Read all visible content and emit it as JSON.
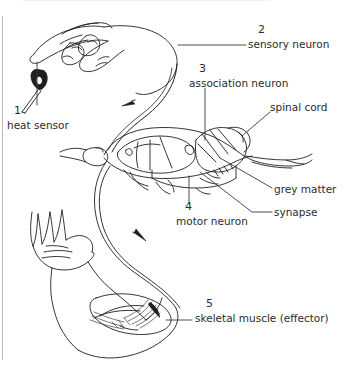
{
  "figure": {
    "type": "biology-diagram",
    "frame": {
      "left_rule_color": "#b8b8b8",
      "background": "#ffffff",
      "ink": "#1f1f1f",
      "text_color": "#2b2b2b"
    }
  },
  "labels": [
    {
      "id": "heat-sensor",
      "number": "1",
      "text": "heat sensor",
      "num_x": 14,
      "num_y": 111,
      "text_x": 9,
      "text_y": 124,
      "leader": "vertical-up-to-fingertip"
    },
    {
      "id": "sensory-neuron",
      "number": "2",
      "text": "sensory neuron",
      "num_x": 260,
      "num_y": 29,
      "text_x": 250,
      "text_y": 42,
      "leader": "horizontal-left"
    },
    {
      "id": "association-neuron",
      "number": "3",
      "text": "association neuron",
      "num_x": 200,
      "num_y": 68,
      "text_x": 190,
      "text_y": 81,
      "leader": "vertical-down"
    },
    {
      "id": "motor-neuron",
      "number": "4",
      "text": "motor neuron",
      "num_x": 186,
      "num_y": 207,
      "text_x": 177,
      "text_y": 220,
      "leader": "vertical-up"
    },
    {
      "id": "skeletal-muscle",
      "number": "5",
      "text": "skeletal muscle (effector)",
      "num_x": 207,
      "num_y": 303,
      "text_x": 196,
      "text_y": 317,
      "leader": "horizontal-left"
    },
    {
      "id": "spinal-cord",
      "number": "",
      "text": "spinal cord",
      "num_x": 0,
      "num_y": 0,
      "text_x": 271,
      "text_y": 106,
      "leader": "diagonal-down-left"
    },
    {
      "id": "grey-matter",
      "number": "",
      "text": "grey matter",
      "num_x": 0,
      "num_y": 0,
      "text_x": 276,
      "text_y": 189,
      "leader": "diagonal-up-left"
    },
    {
      "id": "synapse",
      "number": "",
      "text": "synapse",
      "num_x": 0,
      "num_y": 0,
      "text_x": 276,
      "text_y": 209,
      "leader": "horizontal-left"
    }
  ],
  "arrows": [
    {
      "id": "afferent-arrow",
      "direction": "toward-spinal-cord",
      "on": "sensory pathway"
    },
    {
      "id": "efferent-arrow",
      "direction": "toward-muscle",
      "on": "motor pathway"
    }
  ],
  "drawing_parts": [
    {
      "id": "pointing-hand",
      "description": "hand with extended index finger touching flame/heat source"
    },
    {
      "id": "heat-source",
      "description": "small dark flame on a stick below the fingertip"
    },
    {
      "id": "spinal-cord-section",
      "description": "longitudinal section of spinal cord with grey matter and vertebra"
    },
    {
      "id": "arm-with-muscle",
      "description": "flexed arm, open palm, biceps skeletal muscle highlighted"
    }
  ]
}
